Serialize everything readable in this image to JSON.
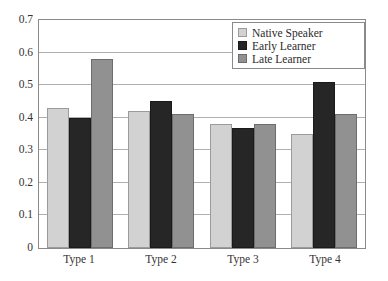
{
  "chart_data": {
    "type": "bar",
    "title": "",
    "xlabel": "",
    "ylabel": "",
    "ylim": [
      0,
      0.7
    ],
    "ytick_labels": [
      "0.7",
      "0.6",
      "0.5",
      "0.4",
      "0.3",
      "0.2",
      "0.1",
      "0"
    ],
    "ytick_values": [
      0.7,
      0.6,
      0.5,
      0.4,
      0.3,
      0.2,
      0.1,
      0
    ],
    "grid": true,
    "legend_position": "top-right",
    "categories": [
      "Type 1",
      "Type 2",
      "Type 3",
      "Type 4"
    ],
    "series": [
      {
        "name": "Native Speaker",
        "color": "#d2d2d2",
        "values": [
          0.43,
          0.42,
          0.38,
          0.35
        ]
      },
      {
        "name": "Early Learner",
        "color": "#262626",
        "values": [
          0.4,
          0.45,
          0.37,
          0.51
        ]
      },
      {
        "name": "Late Learner",
        "color": "#919191",
        "values": [
          0.58,
          0.41,
          0.38,
          0.41
        ]
      }
    ]
  },
  "legend": {
    "items": [
      {
        "label": "Native Speaker",
        "swatch": "native"
      },
      {
        "label": "Early Learner",
        "swatch": "early"
      },
      {
        "label": "Late Learner",
        "swatch": "late"
      }
    ]
  }
}
